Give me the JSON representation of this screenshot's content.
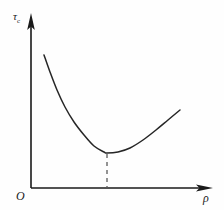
{
  "figure": {
    "background_color": "#fefefe",
    "line_color": "#262626",
    "axis_color": "#1a1a1a",
    "origin_label": "O",
    "y_axis_label_symbol": "τ",
    "y_axis_label_subscript": "c",
    "x_axis_label": "ρ",
    "y_axis_icon": "arrow-up-icon",
    "x_axis_icon": "arrow-right-icon",
    "minimum_marker_style": "dashed"
  },
  "chart_data": {
    "type": "line",
    "title": "",
    "subtitle": "",
    "xlabel": "ρ",
    "ylabel": "τc",
    "xlim": [
      0,
      224
    ],
    "ylim": [
      0,
      210
    ],
    "grid": false,
    "legend": null,
    "axes": {
      "origin_px": [
        31,
        188
      ],
      "y_axis_top_px": [
        31,
        16
      ],
      "x_axis_right_px": [
        212,
        188
      ],
      "x_tick_labels": [],
      "y_tick_labels": []
    },
    "series": [
      {
        "name": "critical shear stress curve",
        "shape": "u-shaped convex",
        "points_px": [
          [
            44,
            55
          ],
          [
            50,
            72
          ],
          [
            57,
            90
          ],
          [
            65,
            107
          ],
          [
            74,
            122
          ],
          [
            84,
            135
          ],
          [
            94,
            146
          ],
          [
            104,
            152
          ],
          [
            107,
            153
          ],
          [
            118,
            152
          ],
          [
            130,
            148
          ],
          [
            143,
            140
          ],
          [
            156,
            130
          ],
          [
            168,
            120
          ],
          [
            180,
            110
          ]
        ]
      }
    ],
    "annotations": [
      {
        "type": "dashed-vertical-line",
        "name": "minimum-dashed-line",
        "from_px": [
          107,
          154
        ],
        "to_px": [
          107,
          188
        ],
        "label": ""
      },
      {
        "type": "minimum-point",
        "name": "curve-minimum",
        "at_px": [
          107,
          153
        ],
        "label": ""
      }
    ]
  }
}
